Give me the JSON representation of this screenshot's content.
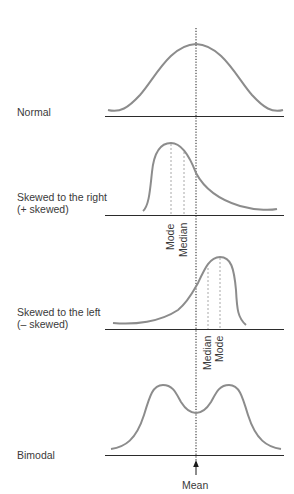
{
  "figure": {
    "mean_axis_label": "Mean",
    "panels": [
      {
        "id": "normal",
        "label_lines": [
          "Normal"
        ],
        "markers": []
      },
      {
        "id": "skewed-right",
        "label_lines": [
          "Skewed to the right",
          "(+ skewed)"
        ],
        "markers": [
          {
            "name": "Mode",
            "x": 171
          },
          {
            "name": "Median",
            "x": 184
          }
        ]
      },
      {
        "id": "skewed-left",
        "label_lines": [
          "Skewed to the left",
          "(– skewed)"
        ],
        "markers": [
          {
            "name": "Median",
            "x": 208
          },
          {
            "name": "Mode",
            "x": 220
          }
        ]
      },
      {
        "id": "bimodal",
        "label_lines": [
          "Bimodal"
        ],
        "markers": []
      }
    ],
    "colors": {
      "curve": "#8c8c8c",
      "axis": "#2b2b2b",
      "mean_line": "#1a1a1a",
      "marker_line": "#a8a8a8",
      "text": "#3a3a3a"
    }
  }
}
